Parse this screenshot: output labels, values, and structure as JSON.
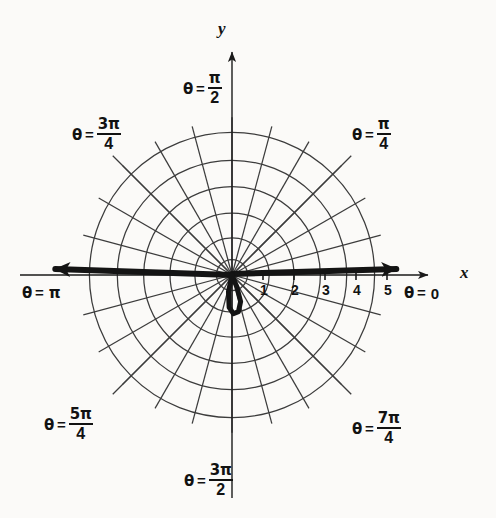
{
  "figure": {
    "kind": "polar-coordinate-plot",
    "background_color": "#fbfaf8",
    "ink_color": "#121212",
    "grid_color": "#3a3a3a"
  },
  "axes": {
    "x_label": "x",
    "y_label": "y"
  },
  "angle_labels": [
    {
      "id": "theta-0",
      "theta_symbol": "θ",
      "equals": "=",
      "value_text": "0",
      "kind": "plain",
      "numerator": "",
      "denominator": "",
      "degrees": 0
    },
    {
      "id": "theta-pi-4",
      "theta_symbol": "θ",
      "equals": "=",
      "value_text": "π/4",
      "kind": "fraction",
      "numerator": "π",
      "denominator": "4",
      "degrees": 45
    },
    {
      "id": "theta-pi-2",
      "theta_symbol": "θ",
      "equals": "=",
      "value_text": "π/2",
      "kind": "fraction",
      "numerator": "π",
      "denominator": "2",
      "degrees": 90
    },
    {
      "id": "theta-3pi-4",
      "theta_symbol": "θ",
      "equals": "=",
      "value_text": "3π/4",
      "kind": "fraction",
      "numerator": "3π",
      "denominator": "4",
      "degrees": 135
    },
    {
      "id": "theta-pi",
      "theta_symbol": "θ",
      "equals": "=",
      "value_text": "π",
      "kind": "plain",
      "numerator": "",
      "denominator": "",
      "degrees": 180
    },
    {
      "id": "theta-5pi-4",
      "theta_symbol": "θ",
      "equals": "=",
      "value_text": "5π/4",
      "kind": "fraction",
      "numerator": "5π",
      "denominator": "4",
      "degrees": 225
    },
    {
      "id": "theta-3pi-2",
      "theta_symbol": "θ",
      "equals": "=",
      "value_text": "3π/2",
      "kind": "fraction",
      "numerator": "3π",
      "denominator": "2",
      "degrees": 270
    },
    {
      "id": "theta-7pi-4",
      "theta_symbol": "θ",
      "equals": "=",
      "value_text": "7π/4",
      "kind": "fraction",
      "numerator": "7π",
      "denominator": "4",
      "degrees": 315
    }
  ],
  "chart_data": {
    "type": "line",
    "coordinate_system": "polar",
    "title": "",
    "xlabel": "x",
    "ylabel": "y",
    "grid": true,
    "legend": false,
    "radial_axis": {
      "tick_labels": [
        "1",
        "2",
        "3",
        "4",
        "5"
      ],
      "tick_values": [
        1,
        2,
        3,
        4,
        5
      ],
      "rlim": [
        0,
        5.6
      ],
      "units_per_pixel": 0.0323,
      "pixels_per_unit": 31
    },
    "angular_axis": {
      "labeled_angles_deg": [
        0,
        45,
        90,
        135,
        180,
        225,
        270,
        315
      ],
      "spoke_count": 24,
      "spoke_step_deg": 15
    },
    "grid_circles": {
      "count": 6,
      "radii_units": [
        0.5,
        1.2,
        2.0,
        2.85,
        3.7,
        4.6
      ]
    },
    "series": [
      {
        "name": "curve-ray-positive-x",
        "description": "heavy ray drawn along theta = 0 out to r = 5.3",
        "theta_deg": 0,
        "r_start": 0,
        "r_end": 5.3,
        "arrow_end": true,
        "stroke_width_px": 6
      },
      {
        "name": "curve-ray-negative-x",
        "description": "heavy ray drawn along theta = pi out to r = 5.7",
        "theta_deg": 180,
        "r_start": 0,
        "r_end": 5.7,
        "arrow_end": true,
        "stroke_width_px": 6
      },
      {
        "name": "curve-inner-loop",
        "description": "small closed loop hanging just below the pole, centred near theta = 3pi/2",
        "points_polar": [
          {
            "theta_deg": 270,
            "r": 0.0
          },
          {
            "theta_deg": 258,
            "r": 0.55
          },
          {
            "theta_deg": 265,
            "r": 1.05
          },
          {
            "theta_deg": 272,
            "r": 1.25
          },
          {
            "theta_deg": 280,
            "r": 1.2
          },
          {
            "theta_deg": 288,
            "r": 0.9
          },
          {
            "theta_deg": 292,
            "r": 0.4
          },
          {
            "theta_deg": 270,
            "r": 0.0
          }
        ],
        "closed": true,
        "stroke_width_px": 5
      }
    ],
    "pole_pixel": {
      "x": 232,
      "y": 275
    }
  }
}
